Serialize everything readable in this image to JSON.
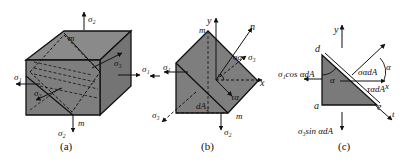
{
  "figure": {
    "panels": [
      {
        "id": "a",
        "caption": "(a)",
        "labels": {
          "sigma2_top": "σ₂",
          "sigma2_bottom": "σ₂",
          "sigma1_left": "σ₁",
          "sigma1_right": "σ₁",
          "sigma3_front": "σ₃",
          "sigma3_back": "σ₃",
          "m_top": "m",
          "m_bottom": "m"
        }
      },
      {
        "id": "b",
        "caption": "(b)",
        "labels": {
          "y_axis": "y",
          "x_axis": "x",
          "n_axis": "n",
          "m_top": "m",
          "m_bottom": "m",
          "sigma_alpha": "σα",
          "tau_alpha": "τα",
          "sigma1": "σ₁",
          "sigma3_left": "σ₃",
          "sigma3_right": "σ₃",
          "sigma2_bottom": "σ₂",
          "alpha": "α",
          "dA2": "dA₂"
        }
      },
      {
        "id": "c",
        "caption": "(c)",
        "labels": {
          "y_axis": "y",
          "x_axis": "x",
          "t_axis": "t",
          "d": "d",
          "a": "a",
          "e": "e",
          "alpha_inner": "α",
          "alpha_outer": "α",
          "sigma1_cos": "σ₁cos αdA",
          "sigma3_sin": "σ₃sin αdA",
          "sigma_alpha_dA": "σαdA",
          "tau_alpha_dA": "ταdA"
        }
      }
    ],
    "colors": {
      "fill": "#7d7d7d",
      "fill_light": "#8e8e8e",
      "fill_dark": "#6a6a6a",
      "stroke": "#111111"
    }
  }
}
